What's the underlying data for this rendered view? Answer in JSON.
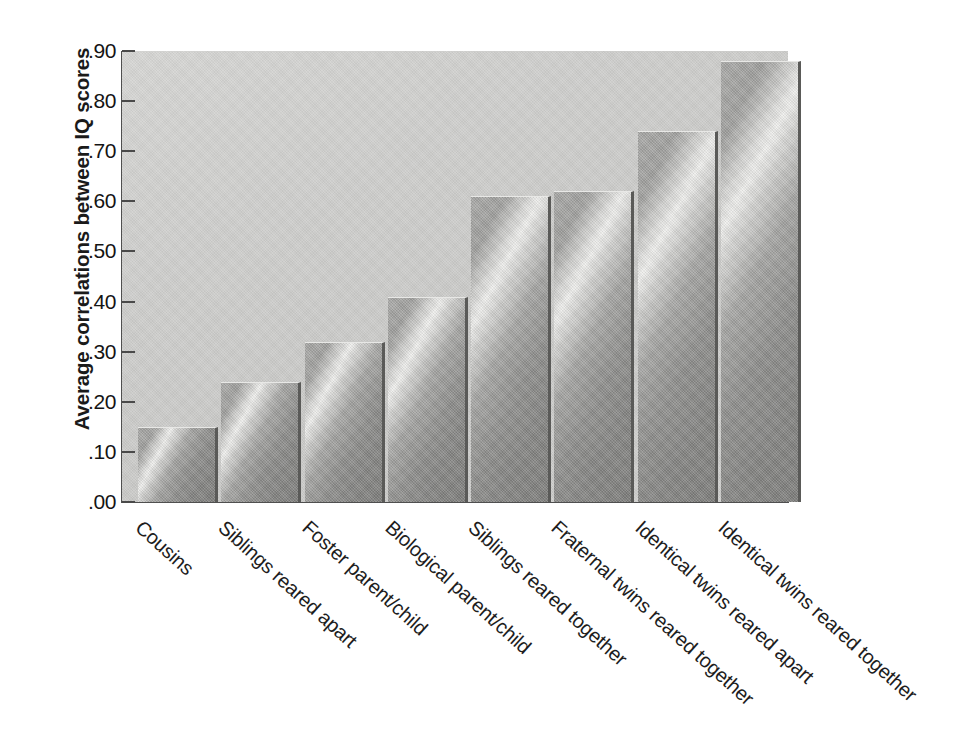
{
  "chart_data": {
    "type": "bar",
    "title": "",
    "xlabel": "",
    "ylabel": "Average correlations between IQ scores",
    "ylim": [
      0.0,
      0.9
    ],
    "grid": false,
    "legend": "none",
    "ytick_labels": [
      ".90",
      ".80",
      ".70",
      ".60",
      ".50",
      ".40",
      ".30",
      ".20",
      ".10",
      ".00"
    ],
    "ytick_values": [
      0.9,
      0.8,
      0.7,
      0.6,
      0.5,
      0.4,
      0.3,
      0.2,
      0.1,
      0.0
    ],
    "categories": [
      "Cousins",
      "Siblings reared apart",
      "Foster parent/child",
      "Biological parent/child",
      "Siblings reared together",
      "Fraternal twins reared together",
      "Identical twins reared apart",
      "Identical twins reared together"
    ],
    "values": [
      0.15,
      0.24,
      0.32,
      0.41,
      0.61,
      0.62,
      0.74,
      0.88
    ]
  },
  "colors": {
    "plot_background": "#cfcfcd",
    "axis_line": "#4f4f4f",
    "bar_light": "#efefed",
    "bar_dark": "#7e7e7c",
    "bar_edge": "#5a5a58",
    "text": "#1a1a1a",
    "page_background": "#ffffff"
  }
}
